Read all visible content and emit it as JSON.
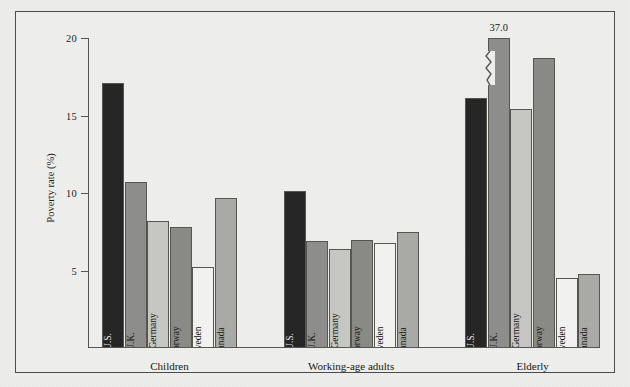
{
  "chart_data": {
    "type": "bar",
    "title": "",
    "xlabel": "",
    "ylabel": "Poverty rate (%)",
    "ylim": [
      0,
      20
    ],
    "yticks": [
      5,
      10,
      15,
      20
    ],
    "ytick_labels": [
      "5",
      "10",
      "15",
      "20"
    ],
    "grid": false,
    "legend": "none",
    "categories": [
      "Children",
      "Working-age adults",
      "Elderly"
    ],
    "series": [
      {
        "name": "U.S.",
        "color": "#232323",
        "values": [
          17.1,
          10.1,
          16.1
        ]
      },
      {
        "name": "U.K.",
        "color": "#8e8e8c",
        "values": [
          10.7,
          6.9,
          37.0
        ]
      },
      {
        "name": "West Germany",
        "color": "#c7c7c4",
        "values": [
          8.2,
          6.4,
          15.4
        ]
      },
      {
        "name": "Norway",
        "color": "#8a8a87",
        "values": [
          7.8,
          7.0,
          18.7
        ]
      },
      {
        "name": "Sweden",
        "color": "#f4f4f2",
        "values": [
          5.2,
          6.8,
          4.5
        ]
      },
      {
        "name": "Canada",
        "color": "#aaaaa7",
        "values": [
          9.7,
          7.5,
          4.8
        ]
      }
    ],
    "annotations": [
      {
        "text": "37.0",
        "series": "U.K.",
        "category": "Elderly",
        "note": "bar truncated with axis-break zigzag"
      }
    ]
  },
  "groups": [
    {
      "label": "Children",
      "bars": [
        {
          "name": "U.S.",
          "value": 17.1,
          "display": 17.1,
          "color": "#232323",
          "label_tone": "dark"
        },
        {
          "name": "U.K.",
          "value": 10.7,
          "display": 10.7,
          "color": "#8e8e8c",
          "label_tone": "light"
        },
        {
          "name": "West Germany",
          "value": 8.2,
          "display": 8.2,
          "color": "#c7c7c4",
          "label_tone": "light"
        },
        {
          "name": "Norway",
          "value": 7.8,
          "display": 7.8,
          "color": "#8a8a87",
          "label_tone": "light"
        },
        {
          "name": "Sweden",
          "value": 5.2,
          "display": 5.2,
          "color": "#f4f4f2",
          "label_tone": "light"
        },
        {
          "name": "Canada",
          "value": 9.7,
          "display": 9.7,
          "color": "#aaaaa7",
          "label_tone": "light"
        }
      ]
    },
    {
      "label": "Working-age adults",
      "bars": [
        {
          "name": "U.S.",
          "value": 10.1,
          "display": 10.1,
          "color": "#232323",
          "label_tone": "dark"
        },
        {
          "name": "U.K.",
          "value": 6.9,
          "display": 6.9,
          "color": "#8e8e8c",
          "label_tone": "light"
        },
        {
          "name": "West Germany",
          "value": 6.4,
          "display": 6.4,
          "color": "#c7c7c4",
          "label_tone": "light"
        },
        {
          "name": "Norway",
          "value": 7.0,
          "display": 7.0,
          "color": "#8a8a87",
          "label_tone": "light"
        },
        {
          "name": "Sweden",
          "value": 6.8,
          "display": 6.8,
          "color": "#f4f4f2",
          "label_tone": "light"
        },
        {
          "name": "Canada",
          "value": 7.5,
          "display": 7.5,
          "color": "#aaaaa7",
          "label_tone": "light"
        }
      ]
    },
    {
      "label": "Elderly",
      "bars": [
        {
          "name": "U.S.",
          "value": 16.1,
          "display": 16.1,
          "color": "#232323",
          "label_tone": "dark"
        },
        {
          "name": "U.K.",
          "value": 20.0,
          "display": 37.0,
          "color": "#8e8e8c",
          "label_tone": "light",
          "truncated": true,
          "annotation": "37.0"
        },
        {
          "name": "West Germany",
          "value": 15.4,
          "display": 15.4,
          "color": "#c7c7c4",
          "label_tone": "light"
        },
        {
          "name": "Norway",
          "value": 18.7,
          "display": 18.7,
          "color": "#8a8a87",
          "label_tone": "light"
        },
        {
          "name": "Sweden",
          "value": 4.5,
          "display": 4.5,
          "color": "#f4f4f2",
          "label_tone": "light"
        },
        {
          "name": "Canada",
          "value": 4.8,
          "display": 4.8,
          "color": "#aaaaa7",
          "label_tone": "light"
        }
      ]
    }
  ]
}
